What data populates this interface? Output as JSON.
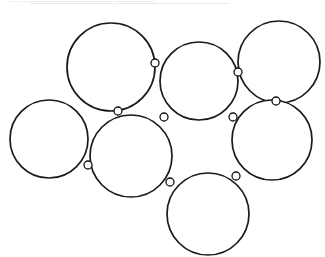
{
  "header": {
    "text": "——  ——————————————  ——  ————",
    "note": "faint cut-off text line at top edge"
  },
  "diagram": {
    "type": "circle-packing",
    "canvas": {
      "width": 325,
      "height": 257,
      "background": "#ffffff"
    },
    "style": {
      "circle_stroke": "#1a1a1a",
      "circle_fill": "#ffffff",
      "circle_stroke_width": 1.7,
      "joint_stroke": "#141414",
      "joint_fill": "#ffffff",
      "joint_stroke_width": 1.3
    },
    "circles": [
      {
        "id": "circle-top-left",
        "label": "A",
        "cx": 111,
        "cy": 67,
        "r": 44
      },
      {
        "id": "circle-left",
        "label": "B",
        "cx": 49,
        "cy": 139,
        "r": 39
      },
      {
        "id": "circle-center-left",
        "label": "C",
        "cx": 131,
        "cy": 156,
        "r": 41
      },
      {
        "id": "circle-center",
        "label": "D",
        "cx": 199,
        "cy": 81,
        "r": 39
      },
      {
        "id": "circle-top-right",
        "label": "E",
        "cx": 279,
        "cy": 62,
        "r": 41
      },
      {
        "id": "circle-right",
        "label": "F",
        "cx": 272,
        "cy": 140,
        "r": 40
      },
      {
        "id": "circle-bottom-center",
        "label": "G",
        "cx": 208,
        "cy": 214,
        "r": 41
      }
    ],
    "joints": [
      {
        "id": "joint-a-d",
        "between": [
          "circle-top-left",
          "circle-center"
        ],
        "cx": 155,
        "cy": 63,
        "r": 4
      },
      {
        "id": "joint-a-c",
        "between": [
          "circle-top-left",
          "circle-center-left"
        ],
        "cx": 118,
        "cy": 111,
        "r": 4
      },
      {
        "id": "joint-c-d",
        "between": [
          "circle-center-left",
          "circle-center"
        ],
        "cx": 164,
        "cy": 117,
        "r": 4
      },
      {
        "id": "joint-b-c",
        "between": [
          "circle-left",
          "circle-center-left"
        ],
        "cx": 88,
        "cy": 165,
        "r": 4
      },
      {
        "id": "joint-d-e",
        "between": [
          "circle-center",
          "circle-top-right"
        ],
        "cx": 238,
        "cy": 72,
        "r": 4
      },
      {
        "id": "joint-d-f",
        "between": [
          "circle-center",
          "circle-right"
        ],
        "cx": 233,
        "cy": 117,
        "r": 4
      },
      {
        "id": "joint-e-f",
        "between": [
          "circle-top-right",
          "circle-right"
        ],
        "cx": 276,
        "cy": 101,
        "r": 4
      },
      {
        "id": "joint-c-g",
        "between": [
          "circle-center-left",
          "circle-bottom-center"
        ],
        "cx": 170,
        "cy": 182,
        "r": 4
      },
      {
        "id": "joint-f-g",
        "between": [
          "circle-right",
          "circle-bottom-center"
        ],
        "cx": 236,
        "cy": 176,
        "r": 4
      }
    ]
  }
}
